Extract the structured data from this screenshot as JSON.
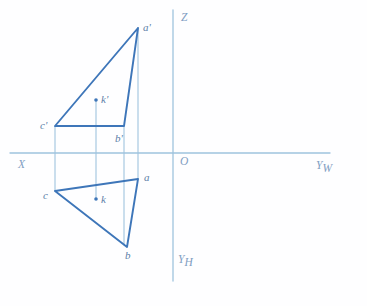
{
  "figure": {
    "type": "descriptive-geometry-projection",
    "width": 367,
    "height": 306,
    "background": "#fefeff"
  },
  "colors": {
    "edge": "#3e76b9",
    "axis": "#9ec3de",
    "projection": "#9ec3de",
    "label": "#5d7fa8",
    "axis_label": "#7e9dc2"
  },
  "axes": {
    "origin": {
      "label": "O",
      "x": 173,
      "y": 153,
      "label_x": 180,
      "label_y": 165
    },
    "horizontal": {
      "name": "X-YW-axis",
      "x1": 10,
      "y1": 153,
      "x2": 330,
      "y2": 153,
      "left_label": "X",
      "left_label_x": 18,
      "left_label_y": 168,
      "right_label": "Y",
      "right_label_sub": "W",
      "right_label_x": 316,
      "right_label_y": 169
    },
    "vertical": {
      "name": "Z-YH-axis",
      "x1": 173,
      "y1": 10,
      "x2": 173,
      "y2": 281,
      "top_label": "Z",
      "top_label_x": 181,
      "top_label_y": 21,
      "bottom_label": "Y",
      "bottom_label_sub": "H",
      "bottom_label_x": 178,
      "bottom_label_y": 263
    }
  },
  "vertical_projection": {
    "name": "frontal-projection-triangle",
    "polygon_points": "138,28 55,126 124,126",
    "vertices": [
      {
        "id": "a-prime",
        "label": "a'",
        "x": 138,
        "y": 28,
        "label_x": 143,
        "label_y": 31
      },
      {
        "id": "c-prime",
        "label": "c'",
        "x": 55,
        "y": 126,
        "label_x": 40,
        "label_y": 129
      },
      {
        "id": "b-prime",
        "label": "b'",
        "x": 124,
        "y": 126,
        "label_x": 115,
        "label_y": 142
      }
    ],
    "point_k": {
      "id": "k-prime",
      "label": "k'",
      "x": 96,
      "y": 100,
      "label_x": 101,
      "label_y": 103,
      "dot_r": 1.8
    }
  },
  "horizontal_projection": {
    "name": "horizontal-projection-triangle",
    "polygon_points": "138,179 55,191 127,247",
    "vertices": [
      {
        "id": "a",
        "label": "a",
        "x": 138,
        "y": 179,
        "label_x": 144,
        "label_y": 181
      },
      {
        "id": "c",
        "label": "c",
        "x": 55,
        "y": 191,
        "label_x": 43,
        "label_y": 199
      },
      {
        "id": "b",
        "label": "b",
        "x": 127,
        "y": 247,
        "label_x": 125,
        "label_y": 259
      }
    ],
    "point_k": {
      "id": "k",
      "label": "k",
      "x": 96,
      "y": 199,
      "label_x": 101,
      "label_y": 203,
      "dot_r": 1.8
    }
  },
  "projection_lines": [
    {
      "name": "projector-c",
      "x1": 55,
      "y1": 126,
      "x2": 55,
      "y2": 191
    },
    {
      "name": "projector-k",
      "x1": 96,
      "y1": 100,
      "x2": 96,
      "y2": 199
    },
    {
      "name": "projector-b",
      "x1": 124,
      "y1": 126,
      "x2": 124,
      "y2": 245
    },
    {
      "name": "projector-a",
      "x1": 138,
      "y1": 28,
      "x2": 138,
      "y2": 179
    }
  ]
}
